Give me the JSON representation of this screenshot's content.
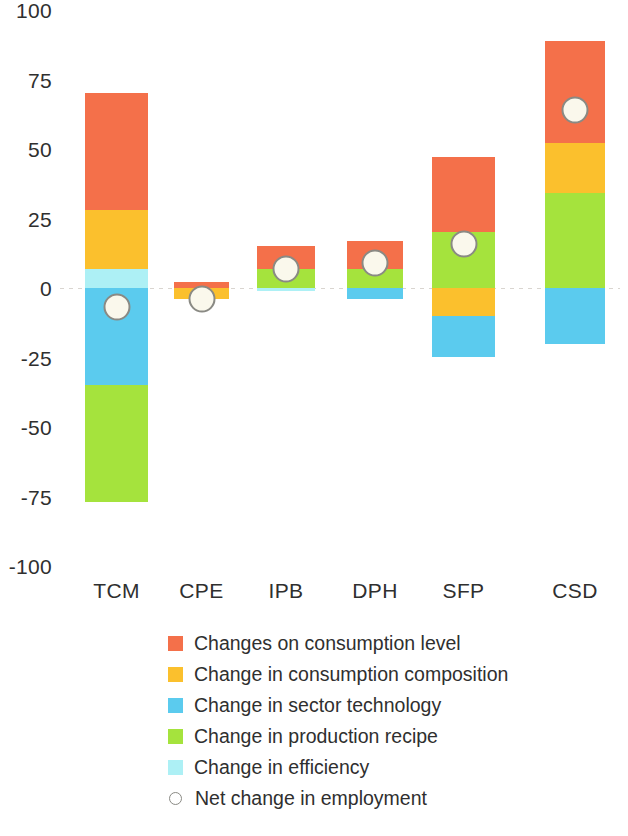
{
  "chart_data": {
    "type": "bar",
    "subtype": "stacked-bar-with-marker",
    "title": "",
    "xlabel": "",
    "ylabel": "",
    "ylim": [
      -100,
      100
    ],
    "ytick_labels": [
      "100",
      "75",
      "50",
      "25",
      "0",
      "-25",
      "-50",
      "-75",
      "-100"
    ],
    "ytick_values": [
      100,
      75,
      50,
      25,
      0,
      -25,
      -50,
      -75,
      -100
    ],
    "grid": false,
    "zero_line": true,
    "legend_position": "bottom",
    "categories": [
      "TCM",
      "CPE",
      "IPB",
      "DPH",
      "SFP",
      "CSD"
    ],
    "series": [
      {
        "name": "Changes on consumption level",
        "color": "#F4704A",
        "values": [
          42,
          2,
          8,
          10,
          27,
          37
        ]
      },
      {
        "name": "Change in consumption composition",
        "color": "#FBC02D",
        "values": [
          21,
          -4,
          0,
          0,
          -10,
          18
        ]
      },
      {
        "name": "Change in sector technology",
        "color": "#5BCBEE",
        "values": [
          -35,
          0,
          0,
          -4,
          -15,
          -20
        ]
      },
      {
        "name": "Change in production recipe",
        "color": "#A5E33D",
        "values": [
          -42,
          0,
          7,
          7,
          20,
          34
        ]
      },
      {
        "name": "Change in efficiency",
        "color": "#ADF0F5",
        "values": [
          7,
          0,
          -1,
          0,
          0,
          0
        ]
      }
    ],
    "marker_series": {
      "name": "Net change in employment",
      "values": [
        -7,
        -4,
        7,
        9,
        16,
        64
      ],
      "marker": "open-circle",
      "fill": "#faf8ec",
      "edge": "#8a8a84"
    }
  },
  "legend": {
    "items": [
      {
        "label": "Changes on consumption level",
        "color": "#F4704A",
        "shape": "square"
      },
      {
        "label": "Change in consumption composition",
        "color": "#FBC02D",
        "shape": "square"
      },
      {
        "label": "Change in sector technology",
        "color": "#5BCBEE",
        "shape": "square"
      },
      {
        "label": "Change in production recipe",
        "color": "#A5E33D",
        "shape": "square"
      },
      {
        "label": "Change in efficiency",
        "color": "#ADF0F5",
        "shape": "square"
      },
      {
        "label": "Net change in employment",
        "color": "#8a8a84",
        "shape": "open-circle"
      }
    ]
  }
}
